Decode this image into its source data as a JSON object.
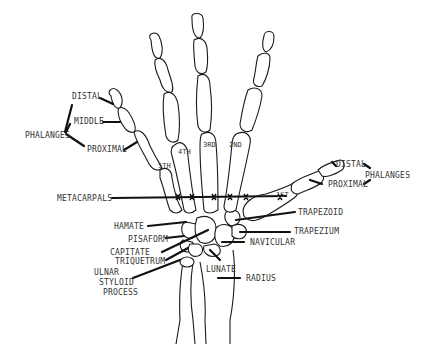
{
  "diagram": {
    "colors": {
      "line": "#1a1a1a",
      "text": "#333333",
      "background": "#ffffff"
    },
    "labels": {
      "left_phalanges": {
        "distal": "DISTAL",
        "middle": "MIDDLE",
        "group": "PHALANGES",
        "proximal": "PROXIMAL"
      },
      "thumb_phalanges": {
        "distal": "DISTAL",
        "group": "PHALANGES",
        "proximal": "PROXIMAL"
      },
      "metacarpals": "METACARPALS",
      "digits": [
        "5TH",
        "4TH",
        "3RD",
        "2ND",
        "1ST"
      ],
      "carpals_left": {
        "hamate": "HAMATE",
        "pisaform": "PISAFORM",
        "capitate": "CAPITATE",
        "triquetrum": "TRIQUETRUM",
        "ulnar_line1": "ULNAR",
        "ulnar_line2": "STYLOID",
        "ulnar_line3": "PROCESS"
      },
      "carpals_right": {
        "trapezoid": "TRAPEZOID",
        "trapezium": "TRAPEZIUM",
        "navicular": "NAVICULAR",
        "lunate": "LUNATE",
        "radius": "RADIUS"
      }
    }
  }
}
